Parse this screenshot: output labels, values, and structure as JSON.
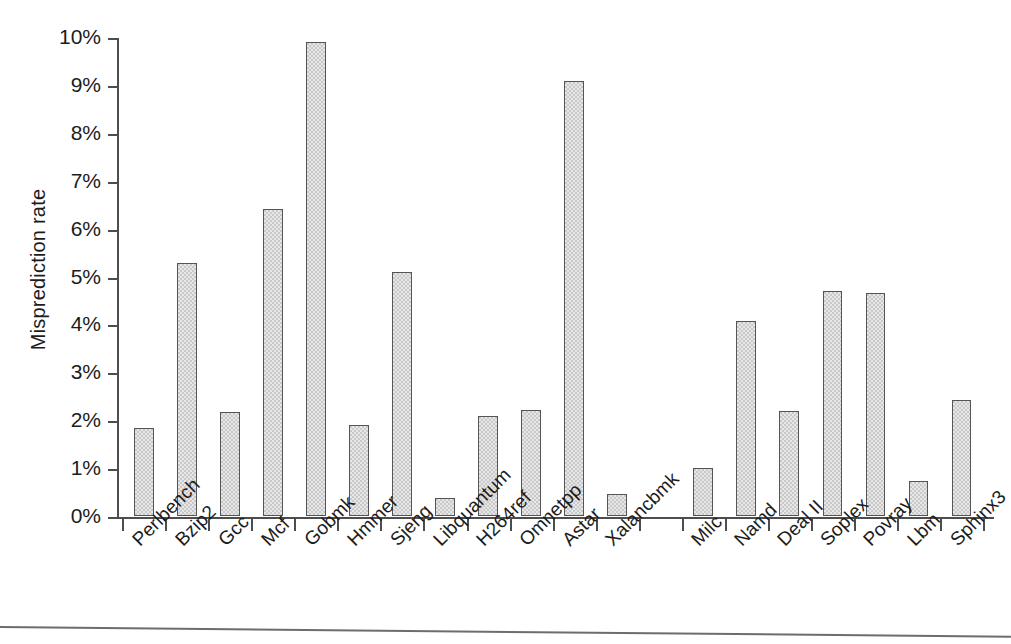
{
  "chart_data": {
    "type": "bar",
    "title": "",
    "xlabel": "",
    "ylabel": "Misprediction rate",
    "ylim": [
      0,
      10
    ],
    "ytick_labels": [
      "0%",
      "1%",
      "2%",
      "3%",
      "4%",
      "5%",
      "6%",
      "7%",
      "8%",
      "9%",
      "10%"
    ],
    "ytick_values": [
      0,
      1,
      2,
      3,
      4,
      5,
      6,
      7,
      8,
      9,
      10
    ],
    "grid": false,
    "legend": "none",
    "units": "percent",
    "group_gap_after_index": 11,
    "categories": [
      "Perlbench",
      "Bzip2",
      "Gcc",
      "Mcf",
      "Gobmk",
      "Hmmer",
      "Sjeng",
      "Libquantum",
      "H264ref",
      "Omnetpp",
      "Astar",
      "Xalancbmk",
      "Milc",
      "Namd",
      "Deal II",
      "Soplex",
      "Povray",
      "Lbm",
      "Sphinx3"
    ],
    "values": [
      1.83,
      5.28,
      2.18,
      6.4,
      9.9,
      1.9,
      5.1,
      0.37,
      2.08,
      2.22,
      9.08,
      0.45,
      1.0,
      4.08,
      2.2,
      4.7,
      4.65,
      0.73,
      2.43
    ]
  },
  "figure": {
    "bar_fill_color": "#c9c9c9",
    "bar_edge_color": "#555555",
    "axis_color": "#4d4d4d",
    "text_color": "#1c1c1c",
    "background_color": "#ffffff"
  }
}
